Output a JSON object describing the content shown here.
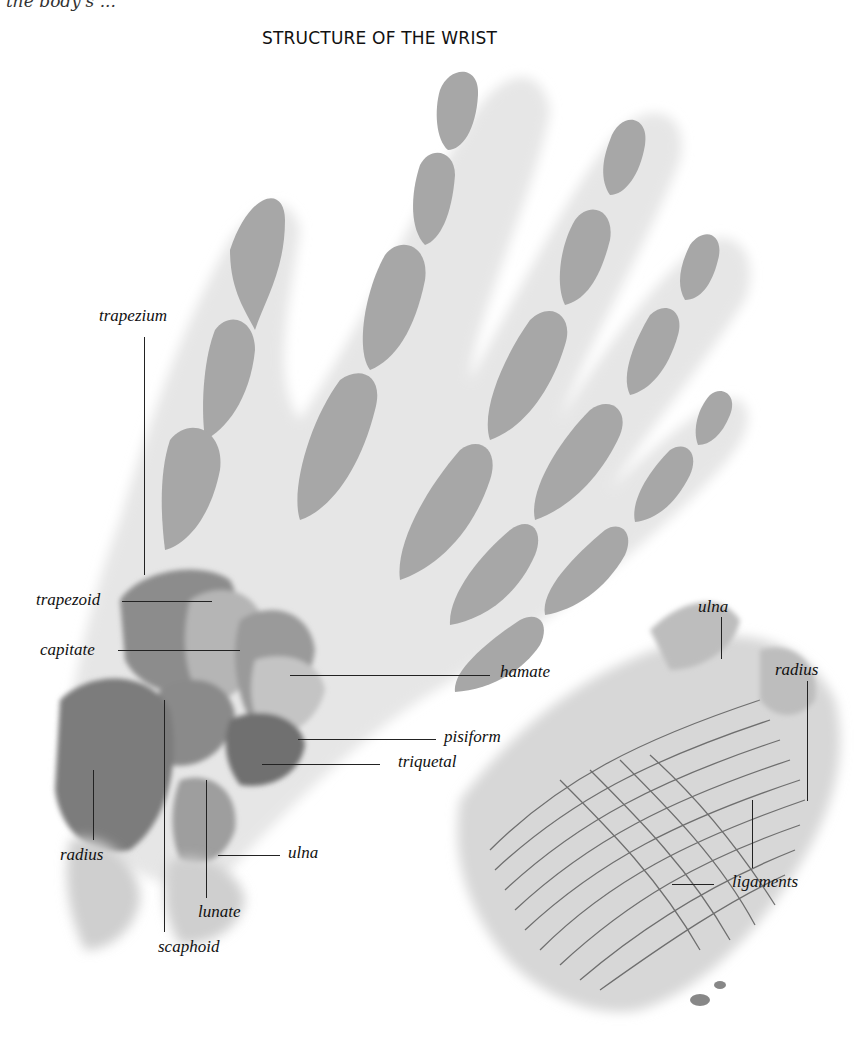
{
  "header": {
    "cut_text": "the body's ... ",
    "title": "STRUCTURE OF THE WRIST"
  },
  "hand_skeleton_labels": [
    {
      "id": "trapezium",
      "text": "trapezium"
    },
    {
      "id": "trapezoid",
      "text": "trapezoid"
    },
    {
      "id": "capitate",
      "text": "capitate"
    },
    {
      "id": "hamate",
      "text": "hamate"
    },
    {
      "id": "pisiform",
      "text": "pisiform"
    },
    {
      "id": "triquetal",
      "text": "triquetal"
    },
    {
      "id": "radius",
      "text": "radius"
    },
    {
      "id": "ulna",
      "text": "ulna"
    },
    {
      "id": "lunate",
      "text": "lunate"
    },
    {
      "id": "scaphoid",
      "text": "scaphoid"
    }
  ],
  "ligament_view_labels": [
    {
      "id": "ulna",
      "text": "ulna"
    },
    {
      "id": "radius",
      "text": "radius"
    },
    {
      "id": "ligaments",
      "text": "ligaments"
    }
  ],
  "colors": {
    "bone_gray": "#a9a9a9",
    "bone_light": "#d6d6d6",
    "outline_dark": "#3a3a3a",
    "label_text": "#111111"
  }
}
